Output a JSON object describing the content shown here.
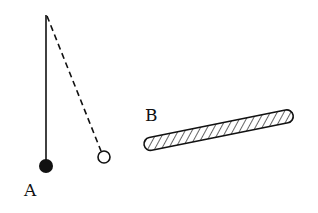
{
  "diagram": {
    "labels": {
      "a": "A",
      "b": "B"
    },
    "colors": {
      "ink": "#111111",
      "background": "#ffffff"
    },
    "elements": {
      "pivot": {
        "x": 46,
        "y": 15
      },
      "ball_a": {
        "x": 46,
        "y": 166,
        "r": 7,
        "fill": "solid"
      },
      "ball_displaced": {
        "x": 104,
        "y": 157,
        "r": 6,
        "fill": "hollow"
      },
      "rod_b": {
        "x1": 150,
        "y1": 144,
        "x2": 291,
        "y2": 116,
        "thickness": 13,
        "pattern": "hatched"
      }
    }
  }
}
